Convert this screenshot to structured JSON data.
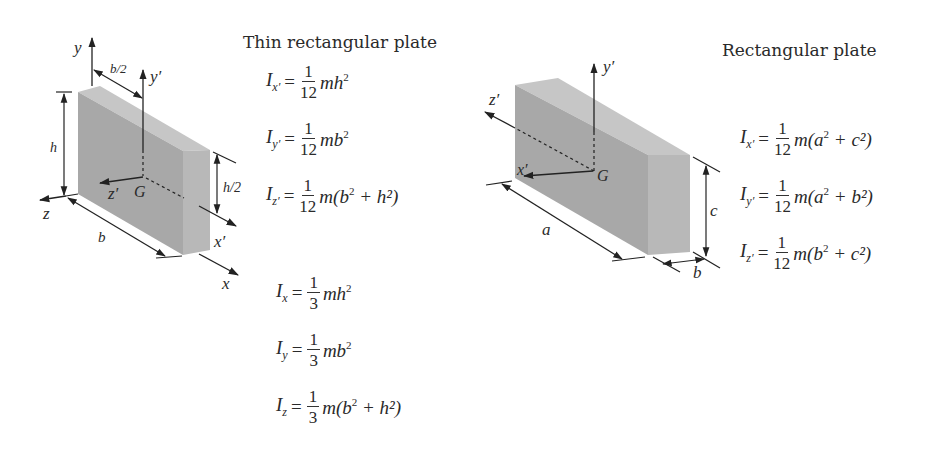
{
  "left": {
    "title": "Thin rectangular plate",
    "labels": {
      "y": "y",
      "y_prime": "y′",
      "b_half": "b/2",
      "h": "h",
      "h_half": "h/2",
      "z": "z",
      "z_prime": "z′",
      "G": "G",
      "b": "b",
      "x_prime": "x′",
      "x": "x"
    },
    "centroidal_equations": [
      {
        "lhs": "I",
        "sub": "x′",
        "num": "1",
        "den": "12",
        "rhs": "mh",
        "rhs_sup": "2",
        "rhs_tail": ""
      },
      {
        "lhs": "I",
        "sub": "y′",
        "num": "1",
        "den": "12",
        "rhs": "mb",
        "rhs_sup": "2",
        "rhs_tail": ""
      },
      {
        "lhs": "I",
        "sub": "z′",
        "num": "1",
        "den": "12",
        "rhs": "m(b",
        "rhs_sup": "2",
        "rhs_tail": " + h²)"
      }
    ],
    "edge_equations": [
      {
        "lhs": "I",
        "sub": "x",
        "num": "1",
        "den": "3",
        "rhs": "mh",
        "rhs_sup": "2",
        "rhs_tail": ""
      },
      {
        "lhs": "I",
        "sub": "y",
        "num": "1",
        "den": "3",
        "rhs": "mb",
        "rhs_sup": "2",
        "rhs_tail": ""
      },
      {
        "lhs": "I",
        "sub": "z",
        "num": "1",
        "den": "3",
        "rhs": "m(b",
        "rhs_sup": "2",
        "rhs_tail": " + h²)"
      }
    ]
  },
  "right": {
    "title": "Rectangular plate",
    "labels": {
      "y_prime": "y′",
      "z_prime": "z′",
      "x_prime": "x′",
      "G": "G",
      "a": "a",
      "b": "b",
      "c": "c"
    },
    "equations": [
      {
        "lhs": "I",
        "sub": "x′",
        "num": "1",
        "den": "12",
        "rhs": "m(a",
        "rhs_sup": "2",
        "rhs_tail": " + c²)"
      },
      {
        "lhs": "I",
        "sub": "y′",
        "num": "1",
        "den": "12",
        "rhs": "m(a",
        "rhs_sup": "2",
        "rhs_tail": " + b²)"
      },
      {
        "lhs": "I",
        "sub": "z′",
        "num": "1",
        "den": "12",
        "rhs": "m(b",
        "rhs_sup": "2",
        "rhs_tail": " + c²)"
      }
    ]
  },
  "colors": {
    "front_face": "#a9a9a9",
    "top_face": "#c8c8c8",
    "side_face": "#b6b6b6",
    "lines": "#222222"
  }
}
